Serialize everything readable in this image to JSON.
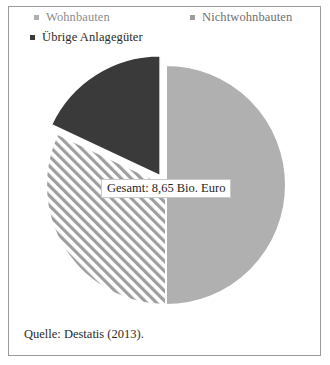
{
  "figure": {
    "background": "#ffffff",
    "border_color": "#9a9a9a"
  },
  "legend": {
    "items": [
      {
        "label": "Wohnbauten",
        "marker": "square-marker",
        "color": "#b0b0b0"
      },
      {
        "label": "Nichtwohnbauten",
        "marker": "square-marker",
        "color": "#9e9e9e"
      },
      {
        "label": "Übrige Anlagegüter",
        "marker": "square-marker",
        "color": "#3a3a3a"
      }
    ]
  },
  "center_label": {
    "text": "Gesamt: 8,65 Bio. Euro"
  },
  "source": {
    "text": "Quelle: Destatis (2013)."
  },
  "chart_data": {
    "type": "pie",
    "title": "",
    "subtitle": "",
    "center_annotation": "Gesamt: 8,65 Bio. Euro",
    "total_label": "Gesamt",
    "total_value": 8.65,
    "total_unit": "Bio. Euro",
    "legend_position": "top",
    "start_angle_deg": 0,
    "direction": "clockwise",
    "grid": false,
    "categories": [
      "Wohnbauten",
      "Nichtwohnbauten",
      "Übrige Anlagegüter"
    ],
    "values": [
      50,
      32,
      18
    ],
    "slices": [
      {
        "name": "Wohnbauten",
        "value": 50,
        "fill": "#b0b0b0",
        "pattern": "solid",
        "exploded": false,
        "start_deg": 0,
        "end_deg": 180
      },
      {
        "name": "Nichtwohnbauten",
        "value": 32,
        "fill": "#ffffff",
        "pattern": "diagonal-hatch",
        "hatch_color": "#9a9a9a",
        "exploded": false,
        "start_deg": 180,
        "end_deg": 295
      },
      {
        "name": "Übrige Anlagegüter",
        "value": 18,
        "fill": "#3a3a3a",
        "pattern": "solid",
        "exploded": true,
        "start_deg": 295,
        "end_deg": 360
      }
    ],
    "xlabel": "",
    "ylabel": ""
  }
}
